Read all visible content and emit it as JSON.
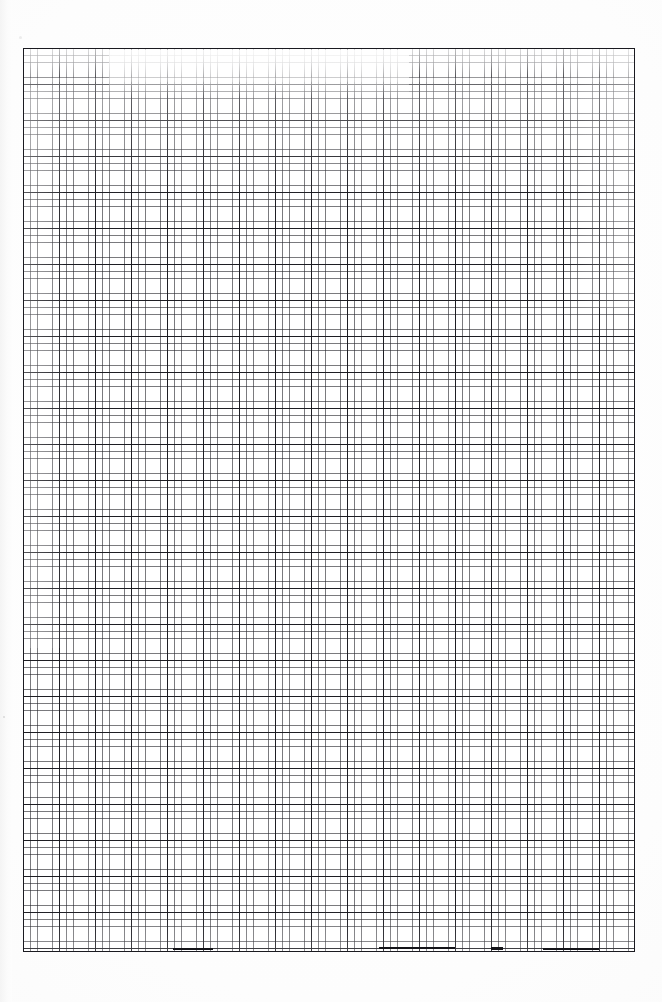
{
  "document": {
    "kind": "scanned-graph-paper",
    "title": "Blank graph paper sheet (scan)",
    "caption": "Blank quadrille / graph paper sheet, scanned. No printed text, labels, headings or annotations are present.",
    "background_color": "#fdfdfd",
    "page_width_px": 662,
    "page_height_px": 1002
  },
  "sheet": {
    "name": "graph-paper-sheet",
    "left_px": 23,
    "top_px": 48,
    "width_px": 612,
    "height_px": 904,
    "paper_color": "#ffffff",
    "border_color": "#1a1a20",
    "border_width_px": 1.6
  },
  "grid": {
    "minor": {
      "label": "minor gridline",
      "spacing_px": 7.2,
      "line_width_px": 0.8,
      "color": "#28282e",
      "opacity": 0.62,
      "columns": 85,
      "rows": 125
    },
    "major": {
      "label": "major gridline",
      "spacing_px": 36,
      "cells_per_major": 5,
      "line_width_px": 1.25,
      "color": "#16161c",
      "opacity": 0.92,
      "columns": 17,
      "rows": 25
    }
  },
  "artifacts": {
    "description": "Scanner wash-out and ink-bleed irregularities",
    "regions": [
      {
        "name": "fade-top-major",
        "note": "top rows washed out / very light"
      },
      {
        "name": "fade-top-patch",
        "note": "bright patch upper-centre-left"
      },
      {
        "name": "fade-upper-wash",
        "note": "broad light wash over upper third"
      },
      {
        "name": "fade-right-col",
        "note": "light column near right edge, upper area"
      },
      {
        "name": "fade-left-col",
        "note": "light column near left edge"
      },
      {
        "name": "fade-bottom-band",
        "note": "slight lightening near bottom"
      }
    ],
    "ink_segments": [
      {
        "name": "ink-bottom-a",
        "note": "thick dark segment on bottom rule"
      },
      {
        "name": "ink-bottom-b",
        "note": "short heavy tick on bottom rule"
      },
      {
        "name": "ink-bottom-c",
        "note": "thick dark segment right of centre"
      },
      {
        "name": "ink-bottom-d",
        "note": "thick dark segment left of centre"
      }
    ],
    "specks": [
      {
        "name": "speck-left",
        "note": "dust speck on left margin"
      },
      {
        "name": "speck-corner",
        "note": "dust speck near top-left corner"
      }
    ]
  }
}
